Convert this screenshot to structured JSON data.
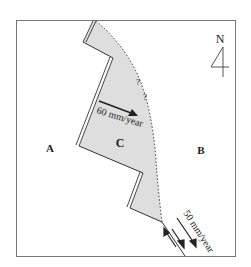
{
  "diagram": {
    "north_label": "N",
    "plates": {
      "a": "A",
      "b": "B",
      "c": "C"
    },
    "rates": {
      "plate_c_motion": "60 mm/year",
      "transform_fault_rate": "50 mm/year"
    },
    "uncertainty_marks": [
      "?",
      "?"
    ],
    "colors": {
      "plate_c_fill": "#dedede",
      "lines": "#333333",
      "frame": "#777777"
    }
  }
}
